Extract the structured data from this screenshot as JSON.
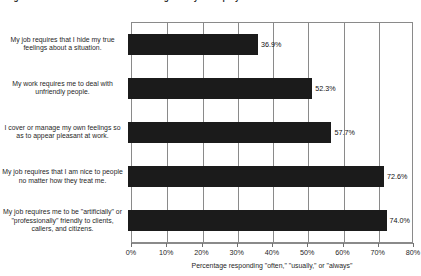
{
  "figure": {
    "title": "Figure: Emotional labor demands among surveyed employees",
    "title_clipped": true
  },
  "chart_data": {
    "type": "bar",
    "orientation": "horizontal",
    "title": "",
    "xlabel": "Percentage responding \"often,\" \"usually,\" or \"always\"",
    "ylabel": "",
    "xlim": [
      0,
      80
    ],
    "xtick_labels": [
      "0%",
      "10%",
      "20%",
      "30%",
      "40%",
      "50%",
      "60%",
      "70%",
      "80%"
    ],
    "xtick_values": [
      0,
      10,
      20,
      30,
      40,
      50,
      60,
      70,
      80
    ],
    "grid": true,
    "grid_axis": "x",
    "legend": false,
    "bar_color": "#1b1b1b",
    "categories": [
      "My job requires that I hide my true feelings about a situation.",
      "My work requires me to deal with unfriendly people.",
      "I cover or manage my own feelings so as to appear pleasant at work.",
      "My job requires that I am nice to people no matter how they treat me.",
      "My job requires me to be \"artificially\" or \"professionally\" friendly to clients, callers, and citizens."
    ],
    "values": [
      36.9,
      52.3,
      57.7,
      72.6,
      74.0
    ],
    "value_labels": [
      "36.9%",
      "52.3%",
      "57.7%",
      "72.6%",
      "74.0%"
    ]
  }
}
